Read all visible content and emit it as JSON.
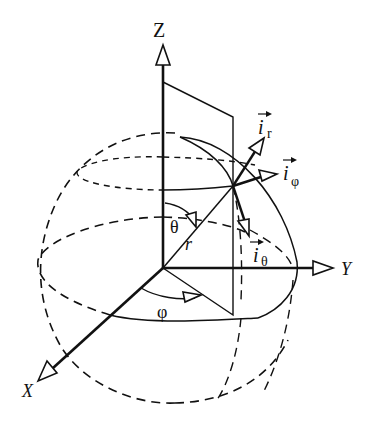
{
  "diagram": {
    "axes": {
      "z_label": "Z",
      "y_label": "Y",
      "x_label": "X"
    },
    "angles": {
      "theta_label": "θ",
      "phi_label": "φ"
    },
    "radius_label": "r",
    "unit_vectors": {
      "ir": {
        "base": "i",
        "sub": "r"
      },
      "iphi": {
        "base": "i",
        "sub": "φ"
      },
      "itheta": {
        "base": "i",
        "sub": "θ"
      }
    },
    "colors": {
      "ink": "#111111",
      "background": "#ffffff"
    }
  }
}
